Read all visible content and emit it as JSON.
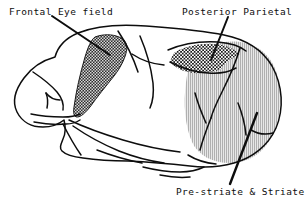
{
  "figure": {
    "background_color": "#ffffff",
    "ink_color": "#0d0d0d",
    "width": 307,
    "height": 208
  },
  "labels": {
    "frontal_eye_field": "Frontal  Eye field",
    "posterior_parietal": "Posterior  Parietal",
    "prestriate_striate": "Pre-striate & Striate"
  },
  "regions": [
    {
      "name": "frontal-eye-field",
      "label": "Frontal  Eye field",
      "fill_style": "dark-crosshatch",
      "fill_color": "#4a4a4a"
    },
    {
      "name": "posterior-parietal",
      "label": "Posterior  Parietal",
      "fill_style": "light-checker-dots",
      "fill_color": "#f2f2f2"
    },
    {
      "name": "prestriate-striate",
      "label": "Pre-striate & Striate",
      "fill_style": "vertical-line-hatch",
      "fill_color": "#c9c9c9"
    }
  ],
  "leader_lines": [
    {
      "name": "leader-frontal-eye-field",
      "from_label": "Frontal  Eye field"
    },
    {
      "name": "leader-posterior-parietal",
      "from_label": "Posterior  Parietal"
    },
    {
      "name": "leader-prestriate-striate",
      "from_label": "Pre-striate & Striate"
    }
  ]
}
